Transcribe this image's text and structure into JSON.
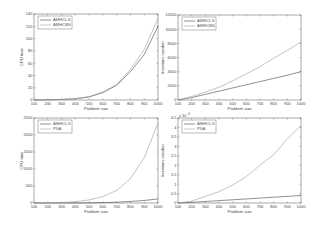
{
  "chart_data": [
    {
      "id": "tl",
      "type": "line",
      "title": "",
      "xlabel": "Problem size",
      "ylabel": "CPU time",
      "x": [
        100,
        200,
        300,
        400,
        500,
        600,
        700,
        800,
        900,
        1000
      ],
      "xticks": [
        100,
        200,
        300,
        400,
        500,
        600,
        700,
        800,
        900,
        1000
      ],
      "yticks": [
        0,
        20,
        40,
        60,
        80,
        100,
        120,
        140
      ],
      "ylim": [
        0,
        140
      ],
      "xlim": [
        100,
        1000
      ],
      "yexp": "",
      "legend_position": "upper left",
      "grid": false,
      "series": [
        {
          "name": "AMHCLS",
          "color": "#444444",
          "values": [
            0,
            0.3,
            0.8,
            2,
            5,
            12,
            24,
            46,
            74,
            120
          ]
        },
        {
          "name": "AMHCBS",
          "color": "#9a9a9a",
          "values": [
            0,
            0.3,
            0.9,
            2.2,
            5.5,
            13,
            25,
            50,
            82,
            133
          ]
        }
      ]
    },
    {
      "id": "tr",
      "type": "line",
      "title": "",
      "xlabel": "Problem size",
      "ylabel": "Iterations number",
      "x": [
        100,
        200,
        300,
        400,
        500,
        600,
        700,
        800,
        900,
        1000
      ],
      "xticks": [
        100,
        200,
        300,
        400,
        500,
        600,
        700,
        800,
        900,
        1000
      ],
      "yticks": [
        0,
        2000,
        4000,
        6000,
        8000,
        10000,
        12000
      ],
      "ylim": [
        0,
        12000
      ],
      "xlim": [
        100,
        1000
      ],
      "yexp": "",
      "legend_position": "upper left",
      "grid": false,
      "series": [
        {
          "name": "AMHCLS",
          "color": "#444444",
          "values": [
            0,
            350,
            800,
            1250,
            1700,
            2150,
            2600,
            3050,
            3500,
            4000
          ]
        },
        {
          "name": "AMHCBS",
          "color": "#9a9a9a",
          "values": [
            0,
            500,
            1100,
            1800,
            2700,
            3700,
            4700,
            5900,
            7000,
            8200
          ]
        }
      ]
    },
    {
      "id": "bl",
      "type": "line",
      "title": "",
      "xlabel": "Problem size",
      "ylabel": "CPU time",
      "x": [
        100,
        200,
        300,
        400,
        500,
        600,
        700,
        800,
        900,
        1000
      ],
      "xticks": [
        100,
        200,
        300,
        400,
        500,
        600,
        700,
        800,
        900,
        1000
      ],
      "yticks": [
        0,
        500,
        1000,
        1500,
        2000,
        2500
      ],
      "ylim": [
        0,
        2500
      ],
      "xlim": [
        100,
        1000
      ],
      "yexp": "",
      "legend_position": "upper left",
      "grid": false,
      "series": [
        {
          "name": "AMHCLS",
          "color": "#444444",
          "values": [
            0,
            0.3,
            0.8,
            2,
            5,
            12,
            24,
            46,
            74,
            120
          ]
        },
        {
          "name": "PSA",
          "color": "#9a9a9a",
          "values": [
            0,
            5,
            15,
            40,
            90,
            190,
            370,
            720,
            1330,
            2350
          ]
        }
      ]
    },
    {
      "id": "br",
      "type": "line",
      "title": "",
      "xlabel": "Problem size",
      "ylabel": "Iterations number",
      "x": [
        100,
        200,
        300,
        400,
        500,
        600,
        700,
        800,
        900,
        1000
      ],
      "xticks": [
        100,
        200,
        300,
        400,
        500,
        600,
        700,
        800,
        900,
        1000
      ],
      "yticks": [
        0,
        0.5,
        1,
        1.5,
        2,
        2.5,
        3,
        3.5,
        4,
        4.5
      ],
      "ylim": [
        0,
        4.5
      ],
      "xlim": [
        100,
        1000
      ],
      "yexp": "x 10^4",
      "legend_position": "upper left",
      "grid": false,
      "series": [
        {
          "name": "AMHCLS",
          "color": "#444444",
          "values": [
            0,
            0.035,
            0.08,
            0.125,
            0.17,
            0.215,
            0.26,
            0.305,
            0.35,
            0.4
          ]
        },
        {
          "name": "PSA",
          "color": "#9a9a9a",
          "values": [
            0,
            0.1,
            0.35,
            0.6,
            0.95,
            1.4,
            2.0,
            2.55,
            3.4,
            4.1
          ]
        }
      ]
    }
  ],
  "labels": {
    "tl": {
      "xlabel": "Problem size",
      "ylabel": "CPU time",
      "legend": [
        "AMHCLS",
        "AMHCBS"
      ]
    },
    "tr": {
      "xlabel": "Problem size",
      "ylabel": "Iterations number",
      "legend": [
        "AMHCLS",
        "AMHCBS"
      ]
    },
    "bl": {
      "xlabel": "Problem size",
      "ylabel": "CPU time",
      "legend": [
        "AMHCLS",
        "PSA"
      ]
    },
    "br": {
      "xlabel": "Problem size",
      "ylabel": "Iterations number",
      "legend": [
        "AMHCLS",
        "PSA"
      ],
      "yexp": "x 10"
    }
  }
}
